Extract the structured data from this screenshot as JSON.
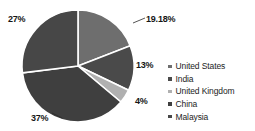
{
  "chart_data": {
    "type": "pie",
    "title": "",
    "categories": [
      "United States",
      "India",
      "United Kingdom",
      "China",
      "Malaysia"
    ],
    "values": [
      19.18,
      13,
      4,
      37,
      27
    ],
    "data_labels": [
      "19.18%",
      "13%",
      "4%",
      "37%",
      "27%"
    ],
    "colors": [
      "#6e6e6e",
      "#4a4a4a",
      "#b0b0b0",
      "#3f3f3f",
      "#474747"
    ],
    "slice_order": "clockwise from 12 o'clock",
    "legend_position": "right",
    "grid": false,
    "separator_color": "#ffffff"
  },
  "labels": {
    "united_states": "19.18%",
    "india": "13%",
    "united_kingdom": "4%",
    "china": "37%",
    "malaysia": "27%"
  },
  "legend": {
    "items": [
      {
        "label": "United States",
        "color": "#6e6e6e"
      },
      {
        "label": "India",
        "color": "#4a4a4a"
      },
      {
        "label": "United Kingdom",
        "color": "#b0b0b0"
      },
      {
        "label": "China",
        "color": "#3f3f3f"
      },
      {
        "label": "Malaysia",
        "color": "#474747"
      }
    ]
  }
}
